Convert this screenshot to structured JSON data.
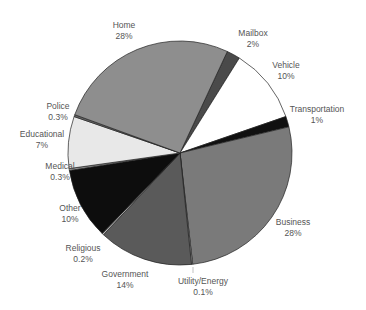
{
  "chart_data": {
    "type": "pie",
    "title": "",
    "center": [
      180,
      153
    ],
    "radius": 112,
    "start_angle_deg": 25,
    "slices": [
      {
        "label": "Mailbox",
        "pct_label": "2%",
        "value": 2,
        "sweep": 7,
        "color": "#4a4a4a",
        "lx": 253,
        "ly": 36
      },
      {
        "label": "Vehicle",
        "pct_label": "10%",
        "value": 10,
        "sweep": 39,
        "color": "#ffffff",
        "lx": 286,
        "ly": 68
      },
      {
        "label": "Transportation",
        "pct_label": "1%",
        "value": 1,
        "sweep": 5.5,
        "color": "#111111",
        "lx": 317,
        "ly": 112
      },
      {
        "label": "Business",
        "pct_label": "28%",
        "value": 28,
        "sweep": 97,
        "color": "#7a7a7a",
        "lx": 293,
        "ly": 225
      },
      {
        "label": "Utility/Energy",
        "pct_label": "0.1%",
        "value": 0.1,
        "sweep": 0.6,
        "color": "#cfcfcf",
        "lx": 203,
        "ly": 284
      },
      {
        "label": "Government",
        "pct_label": "14%",
        "value": 14,
        "sweep": 49,
        "color": "#5a5a5a",
        "lx": 125,
        "ly": 277
      },
      {
        "label": "Religious",
        "pct_label": "0.2%",
        "value": 0.2,
        "sweep": 0.9,
        "color": "#bbbbbb",
        "lx": 83,
        "ly": 251
      },
      {
        "label": "Other",
        "pct_label": "10%",
        "value": 10,
        "sweep": 37,
        "color": "#0d0d0d",
        "lx": 70,
        "ly": 211
      },
      {
        "label": "Medical",
        "pct_label": "0.3%",
        "value": 0.3,
        "sweep": 1,
        "color": "#9a9a9a",
        "lx": 60,
        "ly": 169
      },
      {
        "label": "Educational",
        "pct_label": "7%",
        "value": 7,
        "sweep": 27,
        "color": "#e8e8e8",
        "lx": 42,
        "ly": 137
      },
      {
        "label": "Police",
        "pct_label": "0.3%",
        "value": 0.3,
        "sweep": 1,
        "color": "#6a6a6a",
        "lx": 58,
        "ly": 109
      },
      {
        "label": "Home",
        "pct_label": "28%",
        "value": 28,
        "sweep": 95,
        "color": "#8e8e8e",
        "lx": 124,
        "ly": 28
      }
    ]
  }
}
